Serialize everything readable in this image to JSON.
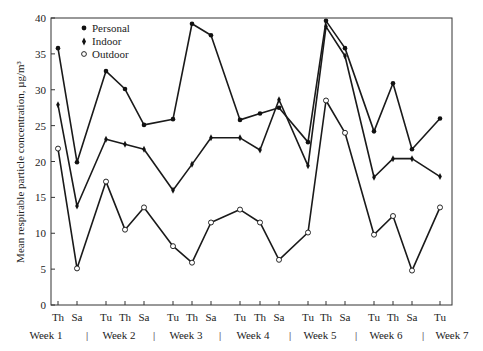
{
  "chart_data": {
    "type": "line",
    "title": "",
    "xlabel": "",
    "ylabel": "Mean respirable particle concentration, µg/m³",
    "ylim": [
      0,
      40
    ],
    "yticks": [
      0,
      5,
      10,
      15,
      20,
      25,
      30,
      35,
      40
    ],
    "grid": false,
    "legend_position": "upper-left",
    "categories": [
      "Th",
      "Sa",
      "Tu",
      "Th",
      "Sa",
      "Tu",
      "Th",
      "Sa",
      "Tu",
      "Th",
      "Sa",
      "Tu",
      "Th",
      "Sa",
      "Tu",
      "Th",
      "Sa",
      "Tu"
    ],
    "x_positions": [
      58,
      77,
      106,
      125,
      144,
      173,
      192,
      211,
      240,
      260,
      279,
      308,
      326,
      345,
      374,
      393,
      412,
      440
    ],
    "week_labels": [
      {
        "label": "Week 1",
        "x": 46
      },
      {
        "label": "Week 2",
        "x": 119
      },
      {
        "label": "Week 3",
        "x": 186
      },
      {
        "label": "Week 4",
        "x": 253
      },
      {
        "label": "Week 5",
        "x": 320
      },
      {
        "label": "Week 6",
        "x": 386
      },
      {
        "label": "Week 7",
        "x": 452
      }
    ],
    "week_separators": [
      87,
      154,
      220,
      290,
      356,
      423
    ],
    "series": [
      {
        "name": "Personal",
        "marker": "filled-circle",
        "values": [
          35.8,
          19.9,
          32.6,
          30.1,
          25.1,
          25.9,
          39.2,
          37.6,
          25.8,
          26.7,
          27.5,
          22.7,
          39.6,
          35.8,
          24.2,
          30.9,
          21.7,
          26.0
        ]
      },
      {
        "name": "Indoor",
        "marker": "filled-diamond",
        "values": [
          27.9,
          13.8,
          23.1,
          22.4,
          21.7,
          16.0,
          19.6,
          23.3,
          23.3,
          21.6,
          28.6,
          19.4,
          38.8,
          34.7,
          17.8,
          20.4,
          20.4,
          17.9
        ]
      },
      {
        "name": "Outdoor",
        "marker": "open-circle",
        "values": [
          21.8,
          5.1,
          17.2,
          10.5,
          13.6,
          8.2,
          5.9,
          11.5,
          13.3,
          11.5,
          6.3,
          10.1,
          28.5,
          24.0,
          9.8,
          12.4,
          4.8,
          13.6
        ]
      }
    ]
  },
  "legend": {
    "items": [
      {
        "label": "Personal"
      },
      {
        "label": "Indoor"
      },
      {
        "label": "Outdoor"
      }
    ]
  },
  "axis": {
    "ylabel": "Mean respirable particle concentration, µg/m³",
    "separator_glyph": "|"
  }
}
